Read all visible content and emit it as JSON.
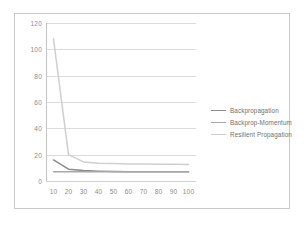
{
  "chart_data": {
    "type": "line",
    "title": "",
    "xlabel": "",
    "ylabel": "",
    "x": [
      10,
      20,
      30,
      40,
      50,
      60,
      70,
      80,
      90,
      100
    ],
    "xtick_labels": [
      "10",
      "20",
      "30",
      "40",
      "50",
      "60",
      "70",
      "80",
      "90",
      "100"
    ],
    "ytick_labels": [
      "0",
      "20",
      "40",
      "60",
      "80",
      "100",
      "120"
    ],
    "yticks": [
      0,
      20,
      40,
      60,
      80,
      100,
      120
    ],
    "ylim": [
      0,
      120
    ],
    "grid": "horizontal",
    "legend_position": "right",
    "series": [
      {
        "name": "Backpropagation",
        "color": "#8a8a8a",
        "values": [
          16,
          9,
          8,
          7.5,
          7.2,
          7.1,
          7.0,
          7.0,
          7.0,
          7.0
        ]
      },
      {
        "name": "Backprop-Momentum",
        "color": "#a8a8a8",
        "values": [
          7,
          7,
          7,
          7,
          7,
          7,
          7,
          7,
          7,
          7
        ]
      },
      {
        "name": "Resilient Propagation",
        "color": "#cfcfcf",
        "values": [
          108,
          20,
          14.5,
          13.5,
          13.2,
          13.0,
          12.9,
          12.8,
          12.7,
          12.6
        ]
      }
    ]
  },
  "legend": {
    "entries": [
      {
        "label": "Backpropagation"
      },
      {
        "label": "Backprop-Momentum"
      },
      {
        "label": "Resilient Propagation"
      }
    ]
  },
  "colors": {
    "frame": "#c9c9c9",
    "gridline": "#dcdcdc",
    "axis": "#c4c4c4",
    "tick_text": "#8c8c8c",
    "legend_text": "#6f6f6f",
    "background": "#ffffff"
  }
}
